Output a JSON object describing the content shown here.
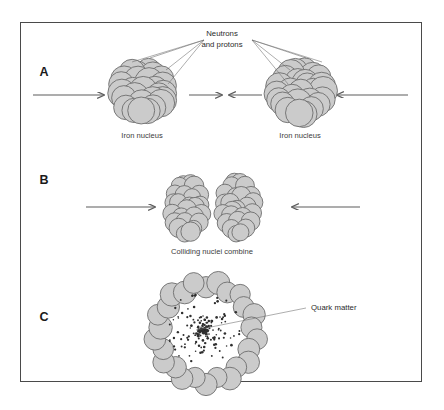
{
  "figure": {
    "colors": {
      "nucleon_fill": "#cbcbcb",
      "nucleon_stroke": "#6d6d6d",
      "frame": "#4a4a4a",
      "text": "#2b2b2b",
      "dot": "#2f2f2f",
      "background": "#ffffff"
    }
  },
  "panels": [
    {
      "letter": "A",
      "letter_x": 44,
      "letter_y": 76,
      "callout": {
        "line1": "Neutrons",
        "line2": "and protons",
        "x": 222,
        "y1": 36,
        "y2": 47
      },
      "captions": [
        {
          "text": "Iron nucleus",
          "x": 142,
          "y": 138
        },
        {
          "text": "Iron nucleus",
          "x": 300,
          "y": 138
        }
      ],
      "arrows": [
        {
          "name": "left-incoming-arrow",
          "x1": 33,
          "y1": 95,
          "x2": 104,
          "y2": 95,
          "dir": "right"
        },
        {
          "name": "center-left-arrow",
          "x1": 189,
          "y1": 95,
          "x2": 222,
          "y2": 95,
          "dir": "right"
        },
        {
          "name": "center-right-arrow",
          "x1": 262,
          "y1": 95,
          "x2": 229,
          "y2": 95,
          "dir": "left"
        },
        {
          "name": "right-incoming-arrow",
          "x1": 408,
          "y1": 95,
          "x2": 337,
          "y2": 95,
          "dir": "left"
        }
      ],
      "nuclei": [
        {
          "name": "iron-nucleus-left",
          "cx": 143,
          "cy": 92,
          "rx": 34,
          "ry": 32,
          "count": 27
        },
        {
          "name": "iron-nucleus-right",
          "cx": 301,
          "cy": 92,
          "rx": 34,
          "ry": 32,
          "count": 27
        }
      ]
    },
    {
      "letter": "B",
      "letter_x": 44,
      "letter_y": 184,
      "captions": [
        {
          "text": "Colliding  nuclei  combine",
          "x": 212,
          "y": 254
        }
      ],
      "arrows": [
        {
          "name": "left-incoming-arrow",
          "x1": 86,
          "y1": 207,
          "x2": 155,
          "y2": 207,
          "dir": "right"
        },
        {
          "name": "right-incoming-arrow",
          "x1": 360,
          "y1": 207,
          "x2": 292,
          "y2": 207,
          "dir": "left"
        }
      ],
      "nuclei": [
        {
          "name": "colliding-nucleus-left",
          "cx": 187,
          "cy": 208,
          "rx": 22,
          "ry": 36,
          "count": 25
        },
        {
          "name": "colliding-nucleus-right",
          "cx": 238,
          "cy": 208,
          "rx": 22,
          "ry": 36,
          "count": 25
        }
      ]
    },
    {
      "letter": "C",
      "letter_x": 44,
      "letter_y": 321,
      "callout": {
        "line1": "Quark matter",
        "x": 311,
        "y1": 310
      },
      "leader": {
        "x1": 196,
        "y1": 330,
        "x2": 306,
        "y2": 308
      },
      "nuclei": [
        {
          "name": "merged-nucleus-shell",
          "cx": 206,
          "cy": 333,
          "rx": 52,
          "ry": 52,
          "count": 26
        }
      ],
      "quark_core": {
        "cx": 203,
        "cy": 330,
        "radius": 40,
        "dots": 230
      }
    }
  ]
}
